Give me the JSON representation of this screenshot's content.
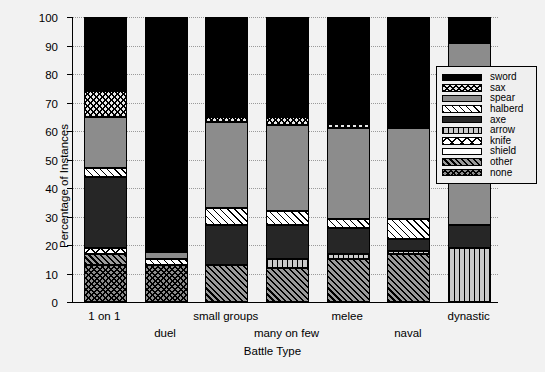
{
  "chart_data": {
    "type": "bar",
    "subtype": "stacked-bar-100",
    "title": "",
    "xlabel": "Battle Type",
    "ylabel": "Percentage of Instances",
    "ylim": [
      0,
      100
    ],
    "yticks": [
      0,
      10,
      20,
      30,
      40,
      50,
      60,
      70,
      80,
      90,
      100
    ],
    "ytick_labels": [
      "0",
      "10",
      "20",
      "30",
      "40",
      "50",
      "60",
      "70",
      "80",
      "90",
      "100"
    ],
    "grid": "horizontal-dotted",
    "legend_position": "right-inside",
    "categories": [
      "1 on 1",
      "duel",
      "small groups",
      "many on few",
      "melee",
      "naval",
      "dynastic"
    ],
    "series": [
      {
        "name": "sword",
        "pattern": "solid-black",
        "values": [
          26,
          82.5,
          35,
          35,
          37.5,
          39,
          9
        ]
      },
      {
        "name": "sax",
        "pattern": "fine-crosshatch",
        "values": [
          9,
          0,
          2,
          3,
          1.5,
          0,
          0
        ]
      },
      {
        "name": "spear",
        "pattern": "solid-gray",
        "values": [
          18,
          2.5,
          30,
          30,
          32,
          32,
          64
        ]
      },
      {
        "name": "halberd",
        "pattern": "diagonal-stripe",
        "values": [
          3,
          2,
          6,
          5,
          3,
          7,
          0
        ]
      },
      {
        "name": "axe",
        "pattern": "solid-dark-gray",
        "values": [
          25,
          0,
          14,
          12,
          9,
          4,
          8
        ]
      },
      {
        "name": "arrow",
        "pattern": "vertical-lines",
        "values": [
          0,
          0,
          0,
          3,
          2,
          1,
          19
        ]
      },
      {
        "name": "knife",
        "pattern": "wide-crosshatch",
        "values": [
          2,
          0,
          0,
          0,
          0,
          0,
          0
        ]
      },
      {
        "name": "shield",
        "pattern": "solid-white",
        "values": [
          0,
          0,
          0,
          0,
          0,
          0,
          0
        ]
      },
      {
        "name": "other",
        "pattern": "dense-diagonal",
        "values": [
          4,
          0,
          13,
          12,
          15,
          17,
          0
        ]
      },
      {
        "name": "none",
        "pattern": "gray-crosshatch",
        "values": [
          13,
          13,
          0,
          0,
          0,
          0,
          0
        ]
      }
    ],
    "stack_order_bottom_to_top": [
      "none",
      "other",
      "shield",
      "knife",
      "arrow",
      "axe",
      "halberd",
      "spear",
      "sax",
      "sword"
    ]
  },
  "legend": {
    "entries": [
      {
        "label": "sword",
        "pattern": "sword"
      },
      {
        "label": "sax",
        "pattern": "sax"
      },
      {
        "label": "spear",
        "pattern": "spear"
      },
      {
        "label": "halberd",
        "pattern": "halberd"
      },
      {
        "label": "axe",
        "pattern": "axe"
      },
      {
        "label": "arrow",
        "pattern": "arrow"
      },
      {
        "label": "knife",
        "pattern": "knife"
      },
      {
        "label": "shield",
        "pattern": "shield"
      },
      {
        "label": "other",
        "pattern": "other"
      },
      {
        "label": "none",
        "pattern": "none"
      }
    ]
  },
  "colors": {
    "background": "#f2f2f2",
    "axis": "#000000",
    "gridline": "#9a9a9a",
    "legend_background": "#efefef"
  }
}
